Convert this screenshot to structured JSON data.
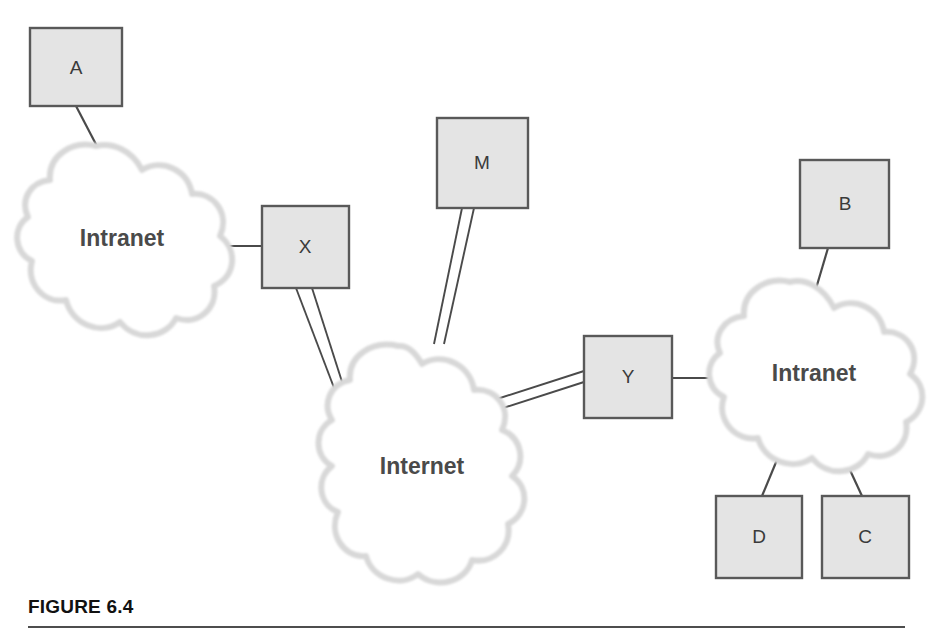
{
  "figure": {
    "caption": "FIGURE 6.4",
    "rule_color": "#4d4d4d"
  },
  "theme": {
    "box_fill": "#e4e4e4",
    "box_stroke": "#595959",
    "cloud_fill": "#ffffff",
    "cloud_stroke": "#d9d9d9",
    "link_color": "#4a4a4a",
    "label_color": "#3a3a3a",
    "cloud_label_color": "#4a4a4a",
    "background": "#ffffff"
  },
  "nodes": {
    "box_a": {
      "label": "A",
      "x": 30,
      "y": 28,
      "w": 92,
      "h": 78
    },
    "box_x": {
      "label": "X",
      "x": 262,
      "y": 206,
      "w": 87,
      "h": 82
    },
    "box_m": {
      "label": "M",
      "x": 437,
      "y": 118,
      "w": 91,
      "h": 90
    },
    "box_y": {
      "label": "Y",
      "x": 584,
      "y": 336,
      "w": 88,
      "h": 82
    },
    "box_b": {
      "label": "B",
      "x": 800,
      "y": 160,
      "w": 89,
      "h": 88
    },
    "box_d": {
      "label": "D",
      "x": 716,
      "y": 496,
      "w": 86,
      "h": 82
    },
    "box_c": {
      "label": "C",
      "x": 822,
      "y": 496,
      "w": 87,
      "h": 82
    }
  },
  "clouds": {
    "intranet_left": {
      "label": "Intranet",
      "cx": 122,
      "cy": 240
    },
    "internet": {
      "label": "Internet",
      "cx": 422,
      "cy": 468
    },
    "intranet_right": {
      "label": "Intranet",
      "cx": 814,
      "cy": 375
    }
  },
  "links": [
    {
      "name": "a-to-intranet-left",
      "type": "single"
    },
    {
      "name": "intranet-left-to-x",
      "type": "single"
    },
    {
      "name": "x-to-internet",
      "type": "double"
    },
    {
      "name": "m-to-internet",
      "type": "double"
    },
    {
      "name": "internet-to-y",
      "type": "double"
    },
    {
      "name": "y-to-intranet-right",
      "type": "single"
    },
    {
      "name": "b-to-intranet-right",
      "type": "single"
    },
    {
      "name": "intranet-right-to-d",
      "type": "single"
    },
    {
      "name": "intranet-right-to-c",
      "type": "single"
    }
  ]
}
